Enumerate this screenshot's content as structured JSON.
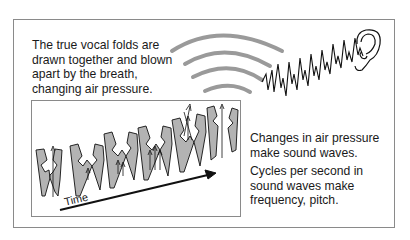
{
  "caption_top": {
    "lines": [
      "The true vocal folds are",
      "drawn together and blown",
      "apart by the breath,",
      "changing air pressure."
    ]
  },
  "caption_right_1": {
    "lines": [
      "Changes in air pressure",
      "make sound waves."
    ]
  },
  "caption_right_2": {
    "lines": [
      "Cycles per second in",
      "sound waves make",
      "frequency, pitch."
    ]
  },
  "diagram": {
    "axis_label": "Time",
    "fold_fill": "#b3b3b3",
    "stroke": "#111111",
    "wave_arc_color": "#9a9a9a",
    "arc_count": 4,
    "icons": [
      "ear-icon",
      "sound-wave-squiggle",
      "time-arrow"
    ]
  }
}
